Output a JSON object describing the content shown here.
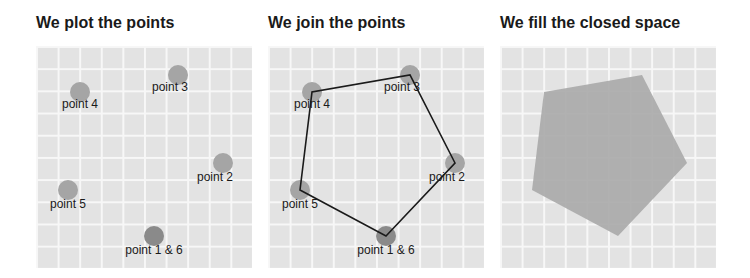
{
  "panels": [
    {
      "title": "We plot the points",
      "mode": "points"
    },
    {
      "title": "We join the points",
      "mode": "lines"
    },
    {
      "title": "We fill the closed space",
      "mode": "fill"
    }
  ],
  "points": [
    {
      "label": "point 1 & 6",
      "x": 118,
      "y": 190
    },
    {
      "label": "point 2",
      "x": 187,
      "y": 117
    },
    {
      "label": "point 3",
      "x": 142,
      "y": 29
    },
    {
      "label": "point 4",
      "x": 44,
      "y": 46
    },
    {
      "label": "point 5",
      "x": 32,
      "y": 144
    }
  ],
  "colors": {
    "point": "#a5a5a5",
    "point_dark": "#8a8a8a",
    "line": "#1a1a1a",
    "fill": "#a8a8a8"
  }
}
